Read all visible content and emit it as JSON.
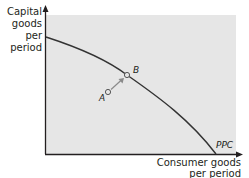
{
  "diagram": {
    "type": "production-possibilities-curve",
    "y_axis_label": [
      "Capital",
      "goods",
      "per",
      "period"
    ],
    "x_axis_label": [
      "Consumer goods",
      "per period"
    ],
    "curve_label": "PPC",
    "points": [
      {
        "label": "A",
        "position": "inside curve"
      },
      {
        "label": "B",
        "position": "on curve"
      }
    ],
    "arrow": {
      "from": "A",
      "to": "B"
    },
    "colors": {
      "plot_background": "#e6e6e6",
      "curve": "#333333",
      "arrow": "#8a8a8a",
      "axis": "#231f20"
    }
  }
}
